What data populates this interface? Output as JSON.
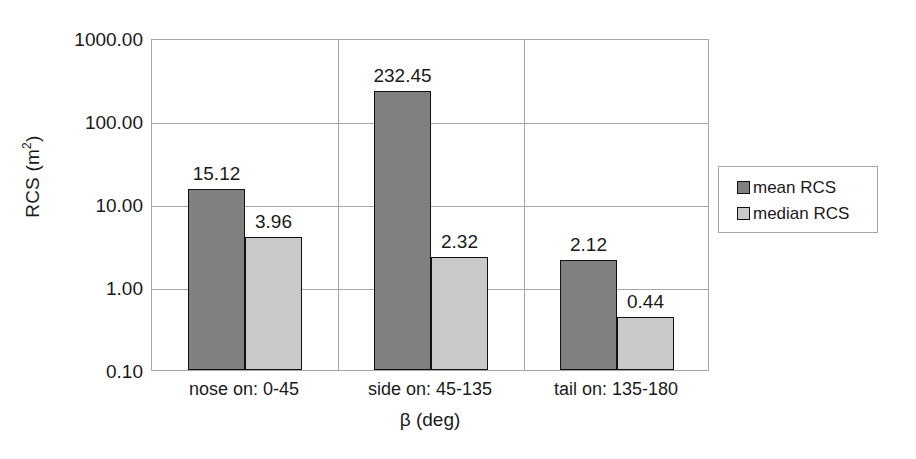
{
  "chart_data": {
    "type": "bar",
    "title": "",
    "subtitle": "",
    "xlabel": "β (deg)",
    "ylabel": "RCS (m²)",
    "ylabel_base": "RCS (m",
    "ylabel_sup": "2",
    "ylabel_tail": ")",
    "yscale": "log",
    "ylim": [
      0.1,
      1000
    ],
    "grid": "horizontal-and-category-separators",
    "legend_position": "right",
    "categories": [
      "nose on:  0-45",
      "side on: 45-135",
      "tail on: 135-180"
    ],
    "y_ticks": [
      "1000.00",
      "100.00",
      "10.00",
      "1.00",
      "0.10"
    ],
    "y_tick_values": [
      1000,
      100,
      10,
      1,
      0.1
    ],
    "series": [
      {
        "name": "mean RCS",
        "color": "#808080",
        "values": [
          15.12,
          232.45,
          2.12
        ],
        "labels": [
          "15.12",
          "232.45",
          "2.12"
        ]
      },
      {
        "name": "median RCS",
        "color": "#c9c9c9",
        "values": [
          3.96,
          2.32,
          0.44
        ],
        "labels": [
          "3.96",
          "2.32",
          "0.44"
        ]
      }
    ]
  },
  "legend": {
    "entries": [
      {
        "label": "mean RCS",
        "swatch": "mean-swatch"
      },
      {
        "label": "median RCS",
        "swatch": "median-swatch"
      }
    ]
  }
}
